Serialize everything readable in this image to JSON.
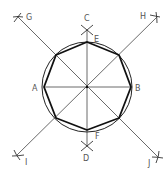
{
  "diagram": {
    "center": {
      "x": 87,
      "y": 87
    },
    "circle_radius": 45,
    "colors": {
      "line": "#444444",
      "octagon": "#111111",
      "label": "#555555",
      "background": "#ffffff"
    },
    "labels": {
      "A": "A",
      "B": "B",
      "C": "C",
      "D": "D",
      "E": "E",
      "F": "F",
      "G": "G",
      "H": "H",
      "I": "I",
      "J": "J"
    }
  }
}
